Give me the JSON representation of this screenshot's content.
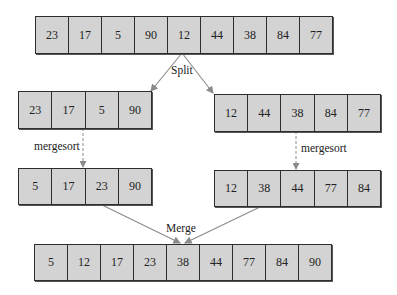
{
  "diagram": {
    "colors": {
      "cell_fill": "#d3d3d3",
      "cell_border": "#2e2e2e",
      "connector": "#8a8a8a",
      "text": "#222222"
    },
    "arrays": {
      "original": [
        23,
        17,
        5,
        90,
        12,
        44,
        38,
        84,
        77
      ],
      "left_half": [
        23,
        17,
        5,
        90
      ],
      "right_half": [
        12,
        44,
        38,
        84,
        77
      ],
      "left_sorted": [
        5,
        17,
        23,
        90
      ],
      "right_sorted": [
        12,
        38,
        44,
        77,
        84
      ],
      "merged": [
        5,
        12,
        17,
        23,
        38,
        44,
        77,
        84,
        90
      ]
    },
    "labels": {
      "split": "Split",
      "mergesort_left": "mergesort",
      "mergesort_right": "mergesort",
      "merge": "Merge"
    }
  }
}
